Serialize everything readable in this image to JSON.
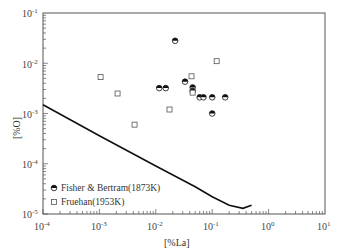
{
  "chart_data": {
    "type": "scatter",
    "title": "",
    "xlabel": "[%La]",
    "ylabel": "[%O]",
    "xscale": "log",
    "yscale": "log",
    "xlim": [
      0.0001,
      10
    ],
    "ylim": [
      1e-05,
      0.1
    ],
    "xticks": [
      "10^-4",
      "10^-3",
      "10^-2",
      "10^-1",
      "10^0",
      "10^1"
    ],
    "yticks": [
      "10^-5",
      "10^-4",
      "10^-3",
      "10^-2",
      "10^-1"
    ],
    "grid": false,
    "legend_position": "lower left",
    "series": [
      {
        "name": "Fisher & Bertram(1873K)",
        "marker": "half-filled circle",
        "points": [
          [
            0.0115,
            0.0032
          ],
          [
            0.015,
            0.0032
          ],
          [
            0.022,
            0.028
          ],
          [
            0.033,
            0.0043
          ],
          [
            0.045,
            0.0033
          ],
          [
            0.045,
            0.0028
          ],
          [
            0.06,
            0.0021
          ],
          [
            0.07,
            0.0021
          ],
          [
            0.1,
            0.0021
          ],
          [
            0.1,
            0.001
          ],
          [
            0.17,
            0.0021
          ]
        ]
      },
      {
        "name": "Fruehan(1953K)",
        "marker": "open square",
        "points": [
          [
            0.00105,
            0.0053
          ],
          [
            0.0021,
            0.0025
          ],
          [
            0.0042,
            0.0006
          ],
          [
            0.0175,
            0.0012
          ],
          [
            0.043,
            0.0055
          ],
          [
            0.045,
            0.0026
          ],
          [
            0.12,
            0.011
          ]
        ]
      },
      {
        "name": "calculated curve",
        "marker": "line",
        "points": [
          [
            0.0001,
            0.0015
          ],
          [
            0.001,
            0.00036
          ],
          [
            0.01,
            9e-05
          ],
          [
            0.05,
            3.5e-05
          ],
          [
            0.1,
            2.2e-05
          ],
          [
            0.2,
            1.5e-05
          ],
          [
            0.35,
            1.3e-05
          ],
          [
            0.5,
            1.5e-05
          ]
        ]
      }
    ]
  },
  "legend": {
    "items": [
      {
        "label": "Fisher & Bertram(1873K)"
      },
      {
        "label": "Fruehan(1953K)"
      }
    ]
  },
  "axes": {
    "xlabel": "[%La]",
    "ylabel": "[%O]",
    "xtick_base": [
      "10",
      "10",
      "10",
      "10",
      "10",
      "10"
    ],
    "xtick_exp": [
      "-4",
      "-3",
      "-2",
      "-1",
      "0",
      "1"
    ],
    "ytick_base": [
      "10",
      "10",
      "10",
      "10",
      "10"
    ],
    "ytick_exp": [
      "-1",
      "-2",
      "-3",
      "-4",
      "-5"
    ]
  }
}
